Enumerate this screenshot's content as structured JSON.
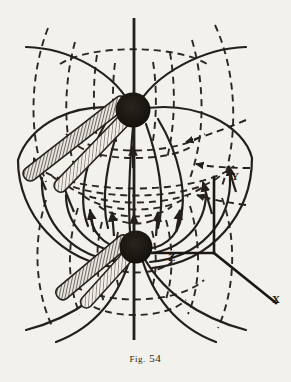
{
  "figure": {
    "caption_prefix": "Fig.",
    "caption_number": "54",
    "caption_full": "Fig. 54",
    "background_color": "#f3f1ec",
    "ink_color": "#241f1c",
    "type": "physics-field-line-diagram"
  },
  "axes": {
    "y_label": "Y",
    "x_label": "X",
    "z_label": "Z",
    "origin": {
      "x": 214,
      "y": 253
    },
    "y_tip": {
      "x": 214,
      "y": 177
    },
    "x_tip": {
      "x": 276,
      "y": 303
    },
    "z_tip": {
      "x": 152,
      "y": 253
    }
  },
  "poles": [
    {
      "name": "upper-pole",
      "cx": 133,
      "cy": 110,
      "r": 17,
      "fill": "#19150f"
    },
    {
      "name": "lower-pole",
      "cx": 136,
      "cy": 247,
      "r": 16,
      "fill": "#19150f"
    }
  ],
  "central_axis": {
    "x": 134,
    "y_top": 18,
    "y_bottom": 340,
    "width": 2.6
  },
  "beams": [
    {
      "name": "upper-beam-outer",
      "angle_deg": -38
    },
    {
      "name": "upper-beam-inner",
      "angle_deg": -42
    },
    {
      "name": "lower-beam-outer",
      "angle_deg": -40
    },
    {
      "name": "lower-beam-inner",
      "angle_deg": -44
    }
  ],
  "legend": {
    "solid_lines": "field lines (solid, arrowed)",
    "dashed_lines": "equipotential lines (dashed)"
  }
}
